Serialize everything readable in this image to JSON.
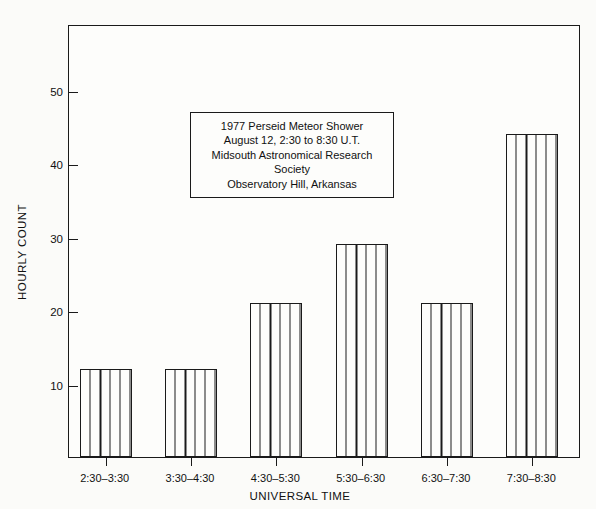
{
  "annotation": {
    "lines": [
      "1977 Perseid Meteor Shower",
      "August 12, 2:30 to 8:30 U.T.",
      "Midsouth Astronomical Research",
      "Society",
      "Observatory Hill, Arkansas"
    ]
  },
  "chart_data": {
    "type": "bar",
    "title": "",
    "xlabel": "UNIVERSAL TIME",
    "ylabel": "HOURLY COUNT",
    "categories": [
      "2:30–3:30",
      "3:30–4:30",
      "4:30–5:30",
      "5:30–6:30",
      "6:30–7:30",
      "7:30–8:30"
    ],
    "values": [
      12,
      12,
      21,
      29,
      21,
      44
    ],
    "ylim": [
      0,
      59
    ],
    "yticks": [
      10,
      20,
      30,
      40,
      50
    ],
    "ytick_labels": [
      "10",
      "20",
      "30",
      "40",
      "50"
    ],
    "grid": false,
    "legend": null,
    "bar_style": "hollow-outline-with-vertical-hatching",
    "colors": {
      "line": "#1a1a1a",
      "bar_fill": "#fdfdfb",
      "background": "#fbfbf9"
    }
  }
}
